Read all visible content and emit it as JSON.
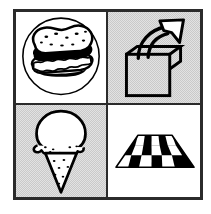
{
  "figure": {
    "layout": "2x2 grid",
    "frame_color": "#2b2b2b",
    "background_color": "#ffffff",
    "gray_panel_color": "#c9c9c9",
    "ink_color": "#000000"
  },
  "panels": [
    {
      "position": "top-left",
      "name": "sandwich",
      "label": "Sandwich in circle",
      "background": "white",
      "icon": "sandwich-icon",
      "description": "A layered sandwich with speckled bread, meat and lettuce, enclosed in a thin circle outline"
    },
    {
      "position": "top-right",
      "name": "box-arrow-out",
      "label": "Arrow out of box",
      "background": "gray",
      "icon": "box-arrow-out-icon",
      "description": "A square box with a curved arrow rising up and out to the upper right"
    },
    {
      "position": "bottom-left",
      "name": "ice-cream-cone",
      "label": "Ice cream cone",
      "background": "gray",
      "icon": "ice-cream-cone-icon",
      "description": "A single round scoop of ice cream on a pointed waffle cone with drips"
    },
    {
      "position": "bottom-right",
      "name": "checkerboard-floor",
      "label": "Checkerboard floor",
      "background": "white",
      "icon": "checkerboard-floor-icon",
      "description": "A black and white checkered floor drawn in perspective",
      "columns": 5,
      "rows": 3
    }
  ]
}
